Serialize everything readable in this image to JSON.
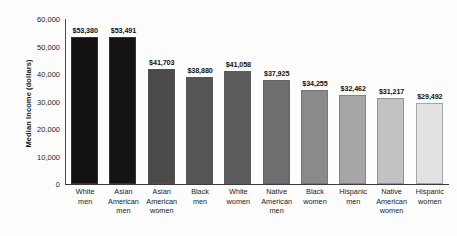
{
  "chart_data": {
    "type": "bar",
    "title": "",
    "xlabel": "",
    "ylabel": "Median Income (dollars)",
    "ylim": [
      0,
      60000
    ],
    "ytick_labels": [
      "60,000",
      "50,000",
      "40,000",
      "30,000",
      "20,000",
      "10,000",
      "0"
    ],
    "ytick_values": [
      60000,
      50000,
      40000,
      30000,
      20000,
      10000,
      0
    ],
    "grid": false,
    "legend": "none",
    "categories": [
      "White men",
      "Asian American men",
      "Asian American women",
      "Black men",
      "White women",
      "Native American men",
      "Black women",
      "Hispanic men",
      "Native American women",
      "Hispanic women"
    ],
    "category_lines": [
      [
        "White",
        "men"
      ],
      [
        "Asian",
        "American",
        "men"
      ],
      [
        "Asian",
        "American",
        "women"
      ],
      [
        "Black",
        "men"
      ],
      [
        "White",
        "women"
      ],
      [
        "Native",
        "American",
        "men"
      ],
      [
        "Black",
        "women"
      ],
      [
        "Hispanic",
        "men"
      ],
      [
        "Native",
        "American",
        "women"
      ],
      [
        "Hispanic",
        "women"
      ]
    ],
    "values": [
      53380,
      53491,
      41703,
      38880,
      41058,
      37925,
      34255,
      32462,
      31217,
      29492
    ],
    "value_labels": [
      "$53,380",
      "$53,491",
      "$41,703",
      "$38,880",
      "$41,058",
      "$37,925",
      "$34,255",
      "$32,462",
      "$31,217",
      "$29,492"
    ],
    "bar_colors": [
      "#111111",
      "#141414",
      "#4a4a4a",
      "#555555",
      "#5b5b5b",
      "#6e6e6e",
      "#8a8a8a",
      "#a6a6a6",
      "#c2c2c2",
      "#e2e2e2"
    ]
  }
}
